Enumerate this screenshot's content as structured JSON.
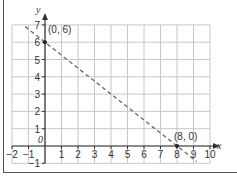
{
  "chart_data": {
    "type": "line",
    "title": "",
    "xlabel": "x",
    "ylabel": "y",
    "xlim": [
      -2,
      10
    ],
    "ylim": [
      -1,
      7
    ],
    "grid": true,
    "x_ticks": [
      "-2",
      "-1",
      "1",
      "2",
      "3",
      "4",
      "5",
      "6",
      "7",
      "8",
      "9",
      "10"
    ],
    "y_ticks": [
      "-1",
      "1",
      "2",
      "3",
      "4",
      "5",
      "6",
      "7"
    ],
    "origin_label": "0",
    "series": [
      {
        "name": "line through (0, 6) and (8, 0)",
        "style": "dashed",
        "color": "#666666",
        "x": [
          -1.2,
          0,
          8,
          9.2
        ],
        "y": [
          6.9,
          6,
          0,
          -0.9
        ]
      }
    ],
    "points": [
      {
        "x": 0,
        "y": 6,
        "label": "(0, 6)"
      },
      {
        "x": 8,
        "y": 0,
        "label": "(8, 0)"
      }
    ],
    "annotations": [
      "(0, 6)",
      "(8, 0)"
    ]
  },
  "colors": {
    "grid": "#c8c8c8",
    "axis": "#333333",
    "line": "#666666",
    "border": "#555555"
  }
}
